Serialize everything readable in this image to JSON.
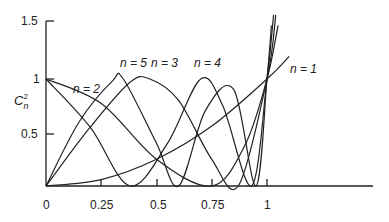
{
  "chart_data": {
    "type": "line",
    "title": "",
    "xlabel": "",
    "ylabel": "C_n^2",
    "xlim": [
      0,
      1.85
    ],
    "ylim": [
      0,
      1.6
    ],
    "x_ticks": [
      "0",
      "0.25",
      "0.5",
      "0.75",
      "1"
    ],
    "y_ticks": [
      "0.5",
      "1",
      "1.5"
    ],
    "grid": false,
    "annotations": [
      "n = 1",
      "n = 2",
      "n = 3",
      "n = 4",
      "n = 5"
    ],
    "series": [
      {
        "name": "n = 1",
        "x": [
          0,
          0.25,
          0.5,
          0.75,
          1.0,
          1.1
        ],
        "values": [
          0,
          0.06,
          0.25,
          0.56,
          1.0,
          1.21
        ]
      },
      {
        "name": "n = 2",
        "x": [
          0,
          0.25,
          0.5,
          0.75,
          0.9,
          1.0,
          1.05
        ],
        "values": [
          1.0,
          0.77,
          0.25,
          0.0,
          0.38,
          1.0,
          1.5
        ]
      },
      {
        "name": "n = 3",
        "x": [
          0,
          0.2,
          0.38,
          0.47,
          0.6,
          0.75,
          0.87,
          1.0,
          1.04
        ],
        "values": [
          0,
          0.55,
          0.97,
          1.0,
          0.8,
          0.25,
          0.0,
          1.0,
          1.6
        ]
      },
      {
        "name": "n = 4",
        "x": [
          0,
          0.2,
          0.38,
          0.55,
          0.7,
          0.8,
          0.93,
          1.0,
          1.03
        ],
        "values": [
          1.0,
          0.55,
          0.0,
          0.4,
          1.0,
          0.75,
          0.0,
          1.0,
          1.6
        ]
      },
      {
        "name": "n = 5",
        "x": [
          0,
          0.15,
          0.3,
          0.35,
          0.5,
          0.6,
          0.72,
          0.85,
          0.95,
          1.0,
          1.02
        ],
        "values": [
          0,
          0.6,
          0.98,
          1.0,
          0.4,
          0.0,
          0.7,
          0.9,
          0.0,
          1.0,
          1.5
        ]
      }
    ]
  },
  "axis": {
    "y_label_main": "C",
    "y_label_sub": "n",
    "y_label_sup": "2",
    "tick_x": [
      "0",
      "0.25",
      "0.5",
      "0.75",
      "1"
    ],
    "tick_y": [
      "1.5",
      "1",
      "0.5"
    ]
  },
  "labels": {
    "n1": "n = 1",
    "n2": "n = 2",
    "n3": "n = 3",
    "n4": "n = 4",
    "n5": "n = 5"
  },
  "colors": {
    "line": "#222222"
  }
}
